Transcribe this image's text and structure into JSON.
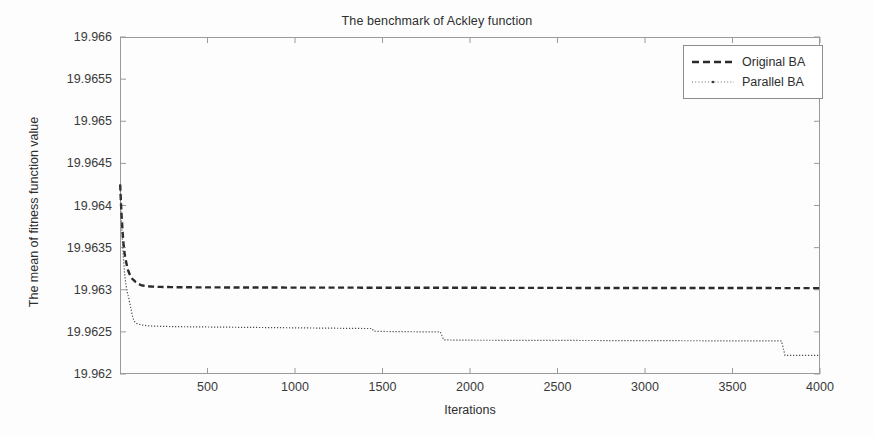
{
  "chart_data": {
    "type": "line",
    "title": "The benchmark of Ackley function",
    "xlabel": "Iterations",
    "ylabel": "The mean of fitness function value",
    "xlim": [
      0,
      4000
    ],
    "ylim": [
      19.962,
      19.966
    ],
    "xticks": [
      500,
      1000,
      1500,
      2000,
      2500,
      3000,
      3500,
      4000
    ],
    "xtick_labels": [
      "500",
      "1000",
      "1500",
      "2000",
      "2500",
      "3000",
      "3500",
      "4000"
    ],
    "yticks": [
      19.962,
      19.9625,
      19.963,
      19.9635,
      19.964,
      19.9645,
      19.965,
      19.9655,
      19.966
    ],
    "ytick_labels": [
      "19.962",
      "19.9625",
      "19.963",
      "19.9635",
      "19.964",
      "19.9645",
      "19.965",
      "19.9655",
      "19.966"
    ],
    "grid": false,
    "legend_position": "upper right",
    "series": [
      {
        "name": "Original BA",
        "style": "dashed",
        "color": "#2b2b2b",
        "x": [
          1,
          5,
          10,
          15,
          20,
          25,
          30,
          35,
          40,
          45,
          50,
          60,
          70,
          80,
          90,
          100,
          120,
          150,
          200,
          300,
          400,
          500,
          700,
          900,
          1100,
          1300,
          1500,
          1700,
          1900,
          2100,
          2300,
          2500,
          2700,
          2900,
          3100,
          3300,
          3500,
          3700,
          3900,
          4000
        ],
        "y": [
          19.96425,
          19.96405,
          19.96385,
          19.96368,
          19.96355,
          19.96345,
          19.96338,
          19.96333,
          19.96328,
          19.96324,
          19.96321,
          19.96316,
          19.96313,
          19.96311,
          19.96309,
          19.963075,
          19.963055,
          19.963042,
          19.963035,
          19.963031,
          19.963029,
          19.963028,
          19.963027,
          19.963026,
          19.963025,
          19.963025,
          19.963024,
          19.963024,
          19.963023,
          19.963023,
          19.963022,
          19.963022,
          19.963021,
          19.963021,
          19.963021,
          19.96302,
          19.96302,
          19.96302,
          19.963019,
          19.963019
        ]
      },
      {
        "name": "Parallel BA",
        "style": "dotted",
        "color": "#4a4a4a",
        "x": [
          1,
          5,
          10,
          15,
          20,
          25,
          30,
          35,
          40,
          45,
          50,
          55,
          60,
          65,
          70,
          75,
          80,
          90,
          100,
          110,
          120,
          130,
          140,
          150,
          170,
          200,
          250,
          300,
          400,
          500,
          600,
          700,
          800,
          900,
          1000,
          1100,
          1200,
          1300,
          1400,
          1440,
          1450,
          1500,
          1600,
          1700,
          1800,
          1830,
          1850,
          1900,
          2000,
          2200,
          2400,
          2600,
          2800,
          3000,
          3200,
          3400,
          3600,
          3780,
          3800,
          3900,
          4000
        ],
        "y": [
          19.96425,
          19.964,
          19.96375,
          19.96352,
          19.96335,
          19.96322,
          19.96312,
          19.96305,
          19.96299,
          19.96294,
          19.9629,
          19.96285,
          19.9628,
          19.96275,
          19.9627,
          19.96266,
          19.96263,
          19.962605,
          19.962595,
          19.96259,
          19.962585,
          19.96258,
          19.962578,
          19.962575,
          19.96257,
          19.962568,
          19.962565,
          19.962563,
          19.96256,
          19.962558,
          19.962556,
          19.962554,
          19.962552,
          19.96255,
          19.962548,
          19.962546,
          19.962544,
          19.962542,
          19.96254,
          19.96254,
          19.962508,
          19.962505,
          19.962503,
          19.962501,
          19.9625,
          19.9625,
          19.962405,
          19.962403,
          19.962401,
          19.9624,
          19.962399,
          19.962398,
          19.962397,
          19.962396,
          19.962395,
          19.962394,
          19.962393,
          19.962392,
          19.962222,
          19.962221,
          19.96222
        ]
      }
    ]
  },
  "legend": {
    "items": [
      {
        "label": "Original BA"
      },
      {
        "label": "Parallel BA"
      }
    ]
  }
}
